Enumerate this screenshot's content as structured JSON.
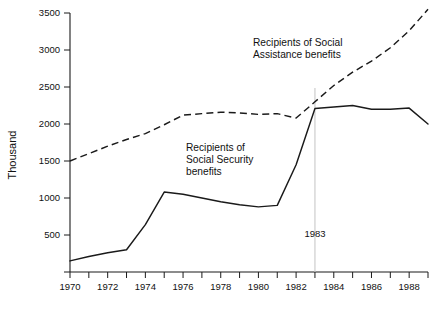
{
  "chart_data": {
    "type": "line",
    "title": "",
    "xlabel": "",
    "ylabel": "Thousand",
    "xlim": [
      1970,
      1989
    ],
    "ylim": [
      0,
      3500
    ],
    "grid": false,
    "legend_position": "inline-annotations",
    "y_ticks": [
      0,
      500,
      1000,
      1500,
      2000,
      2500,
      3000,
      3500
    ],
    "y_tick_labels": [
      "",
      "500",
      "1000",
      "1500",
      "2000",
      "2500",
      "3000",
      "3500"
    ],
    "x_ticks": [
      1970,
      1971,
      1972,
      1973,
      1974,
      1975,
      1976,
      1977,
      1978,
      1979,
      1980,
      1981,
      1982,
      1983,
      1984,
      1985,
      1986,
      1987,
      1988,
      1989
    ],
    "x_tick_labels": [
      "1970",
      "",
      "1972",
      "",
      "1974",
      "",
      "1976",
      "",
      "1978",
      "",
      "1980",
      "",
      "1982",
      "",
      "1984",
      "",
      "1986",
      "",
      "1988",
      ""
    ],
    "x": [
      1970,
      1971,
      1972,
      1973,
      1974,
      1975,
      1976,
      1977,
      1978,
      1979,
      1980,
      1981,
      1982,
      1983,
      1984,
      1985,
      1986,
      1987,
      1988,
      1989
    ],
    "series": [
      {
        "name": "Recipients of Social Assistance benefits",
        "style": "dashed",
        "color": "#1a1a1a",
        "values": [
          1500,
          1600,
          1700,
          1790,
          1870,
          1990,
          2120,
          2140,
          2160,
          2150,
          2130,
          2140,
          2080,
          2300,
          2520,
          2700,
          2850,
          3030,
          3260,
          3550
        ]
      },
      {
        "name": "Recipients of Social Security benefits",
        "style": "solid",
        "color": "#1a1a1a",
        "values": [
          150,
          210,
          260,
          300,
          640,
          1080,
          1050,
          1000,
          950,
          910,
          880,
          900,
          1450,
          2210,
          2230,
          2250,
          2200,
          2200,
          2215,
          2000
        ]
      }
    ],
    "annotations": [
      {
        "name": "social-assistance-label",
        "lines": [
          "Recipients of Social",
          "Assistance benefits"
        ],
        "x": 253,
        "y": 46
      },
      {
        "name": "social-security-label",
        "lines": [
          "Recipients of",
          "Social Security",
          "benefits"
        ],
        "x": 186,
        "y": 151
      }
    ],
    "reference_line": {
      "name": "1983-marker",
      "label": "1983",
      "value": 1983,
      "color": "#c8c8c8"
    }
  }
}
